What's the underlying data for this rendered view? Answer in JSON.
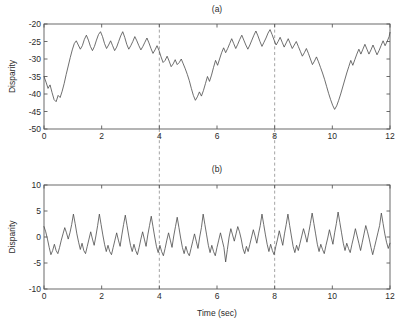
{
  "figure": {
    "xlabel": "Time (sec)",
    "background": "#ffffff",
    "line_color": "#4a4a4a",
    "marker_color": "#9a9a9a",
    "axis_color": "#5a5a5a"
  },
  "chart_data": [
    {
      "type": "line",
      "title": "(a)",
      "xlabel": "",
      "ylabel": "Disparity",
      "xlim": [
        0,
        12
      ],
      "ylim": [
        -50,
        -20
      ],
      "xticks": [
        0,
        2,
        4,
        6,
        8,
        10,
        12
      ],
      "xticklabels": [
        "0",
        "2",
        "4",
        "6",
        "8",
        "10",
        "12"
      ],
      "yticks": [
        -50,
        -45,
        -40,
        -35,
        -30,
        -25,
        -20
      ],
      "yticklabels": [
        "-50",
        "-45",
        "-40",
        "-35",
        "-30",
        "-25",
        "-20"
      ],
      "grid": false,
      "legend": null,
      "annotations": [
        {
          "type": "vline",
          "x": 4,
          "style": "dashed",
          "color": "#9a9a9a"
        },
        {
          "type": "vline",
          "x": 8,
          "style": "dashed",
          "color": "#9a9a9a"
        }
      ],
      "series": [
        {
          "name": "disparity",
          "x": [
            0.0,
            0.07,
            0.14,
            0.21,
            0.28,
            0.35,
            0.42,
            0.49,
            0.56,
            0.63,
            0.7,
            0.77,
            0.84,
            0.91,
            0.98,
            1.05,
            1.12,
            1.19,
            1.26,
            1.33,
            1.4,
            1.47,
            1.54,
            1.61,
            1.68,
            1.75,
            1.82,
            1.89,
            1.96,
            2.03,
            2.1,
            2.17,
            2.24,
            2.31,
            2.38,
            2.45,
            2.52,
            2.59,
            2.66,
            2.73,
            2.8,
            2.87,
            2.94,
            3.01,
            3.08,
            3.15,
            3.22,
            3.29,
            3.36,
            3.43,
            3.5,
            3.57,
            3.64,
            3.71,
            3.78,
            3.85,
            3.92,
            3.99,
            4.06,
            4.13,
            4.2,
            4.27,
            4.34,
            4.41,
            4.48,
            4.55,
            4.62,
            4.69,
            4.76,
            4.83,
            4.9,
            4.97,
            5.04,
            5.11,
            5.18,
            5.25,
            5.32,
            5.39,
            5.46,
            5.53,
            5.6,
            5.67,
            5.74,
            5.81,
            5.88,
            5.95,
            6.02,
            6.09,
            6.16,
            6.23,
            6.3,
            6.37,
            6.44,
            6.51,
            6.58,
            6.65,
            6.72,
            6.79,
            6.86,
            6.93,
            7.0,
            7.07,
            7.14,
            7.21,
            7.28,
            7.35,
            7.42,
            7.49,
            7.56,
            7.63,
            7.7,
            7.77,
            7.84,
            7.91,
            7.98,
            8.05,
            8.12,
            8.19,
            8.26,
            8.33,
            8.4,
            8.47,
            8.54,
            8.61,
            8.68,
            8.75,
            8.82,
            8.89,
            8.96,
            9.03,
            9.1,
            9.17,
            9.24,
            9.31,
            9.38,
            9.45,
            9.52,
            9.59,
            9.66,
            9.73,
            9.8,
            9.87,
            9.94,
            10.01,
            10.08,
            10.15,
            10.22,
            10.29,
            10.36,
            10.43,
            10.5,
            10.57,
            10.64,
            10.71,
            10.78,
            10.85,
            10.92,
            10.99,
            11.06,
            11.13,
            11.2,
            11.27,
            11.34,
            11.41,
            11.48,
            11.55,
            11.62,
            11.69,
            11.76,
            11.83,
            11.9,
            11.97,
            12.0
          ],
          "y": [
            -35.0,
            -36.6,
            -38.4,
            -37.4,
            -39.6,
            -41.6,
            -42.2,
            -40.4,
            -41.0,
            -39.2,
            -37.0,
            -34.4,
            -32.0,
            -29.6,
            -27.4,
            -25.6,
            -24.8,
            -26.0,
            -27.2,
            -26.2,
            -24.4,
            -23.2,
            -24.6,
            -26.4,
            -27.6,
            -26.4,
            -24.6,
            -23.0,
            -22.2,
            -23.6,
            -25.6,
            -27.0,
            -26.0,
            -24.8,
            -26.2,
            -27.6,
            -26.6,
            -25.0,
            -23.4,
            -22.2,
            -23.8,
            -25.8,
            -27.2,
            -26.2,
            -25.0,
            -23.6,
            -24.8,
            -26.2,
            -27.4,
            -26.4,
            -25.2,
            -24.0,
            -25.4,
            -27.0,
            -28.4,
            -27.4,
            -26.2,
            -27.6,
            -29.4,
            -31.0,
            -30.4,
            -29.2,
            -30.6,
            -32.2,
            -31.4,
            -30.2,
            -31.6,
            -31.0,
            -30.0,
            -31.4,
            -32.8,
            -34.4,
            -36.2,
            -38.4,
            -40.4,
            -41.8,
            -40.8,
            -39.4,
            -40.6,
            -39.0,
            -37.0,
            -35.0,
            -36.4,
            -34.6,
            -32.4,
            -30.4,
            -31.8,
            -30.0,
            -28.2,
            -26.8,
            -28.2,
            -27.0,
            -25.6,
            -24.2,
            -25.6,
            -27.0,
            -25.8,
            -24.4,
            -23.2,
            -24.6,
            -26.0,
            -27.2,
            -26.0,
            -24.6,
            -23.2,
            -22.0,
            -23.4,
            -25.0,
            -26.4,
            -25.2,
            -24.0,
            -22.6,
            -21.6,
            -23.0,
            -24.6,
            -26.0,
            -25.0,
            -23.8,
            -25.2,
            -26.6,
            -25.4,
            -24.2,
            -25.6,
            -27.0,
            -26.0,
            -25.0,
            -26.4,
            -27.8,
            -29.2,
            -28.2,
            -27.0,
            -28.4,
            -30.0,
            -31.6,
            -30.6,
            -29.4,
            -30.8,
            -32.4,
            -34.0,
            -35.8,
            -37.8,
            -39.8,
            -41.6,
            -43.2,
            -44.4,
            -43.4,
            -41.8,
            -40.0,
            -38.0,
            -36.0,
            -34.0,
            -32.2,
            -30.4,
            -31.8,
            -30.2,
            -28.6,
            -27.2,
            -28.6,
            -27.2,
            -25.8,
            -27.2,
            -28.6,
            -27.4,
            -26.0,
            -27.4,
            -28.8,
            -27.6,
            -26.2,
            -24.8,
            -26.2,
            -25.0,
            -23.6,
            -22.4,
            -23.8,
            -25.4,
            -24.2,
            -26.0,
            -27.8,
            -26.6,
            -28.4,
            -30.2,
            -29.0,
            -30.8,
            -32.6,
            -34.4,
            -33.2,
            -35.0,
            -36.8,
            -38.6,
            -37.4,
            -39.2,
            -41.0,
            -42.8,
            -44.6,
            -45.6,
            -45.8
          ]
        }
      ]
    },
    {
      "type": "line",
      "title": "(b)",
      "xlabel": "Time (sec)",
      "ylabel": "Disparity",
      "xlim": [
        0,
        12
      ],
      "ylim": [
        -10,
        10
      ],
      "xticks": [
        0,
        2,
        4,
        6,
        8,
        10,
        12
      ],
      "xticklabels": [
        "0",
        "2",
        "4",
        "6",
        "8",
        "10",
        "12"
      ],
      "yticks": [
        -10,
        -5,
        0,
        5,
        10
      ],
      "yticklabels": [
        "-10",
        "-5",
        "0",
        "5",
        "10"
      ],
      "grid": false,
      "legend": null,
      "annotations": [
        {
          "type": "vline",
          "x": 4,
          "style": "dashed",
          "color": "#9a9a9a"
        },
        {
          "type": "vline",
          "x": 8,
          "style": "dashed",
          "color": "#9a9a9a"
        }
      ],
      "series": [
        {
          "name": "residual-disparity",
          "x": [
            0.0,
            0.06,
            0.12,
            0.18,
            0.24,
            0.3,
            0.36,
            0.42,
            0.48,
            0.54,
            0.6,
            0.66,
            0.72,
            0.78,
            0.84,
            0.9,
            0.96,
            1.02,
            1.08,
            1.14,
            1.2,
            1.26,
            1.32,
            1.38,
            1.44,
            1.5,
            1.56,
            1.62,
            1.68,
            1.74,
            1.8,
            1.86,
            1.92,
            1.98,
            2.04,
            2.1,
            2.16,
            2.22,
            2.28,
            2.34,
            2.4,
            2.46,
            2.52,
            2.58,
            2.64,
            2.7,
            2.76,
            2.82,
            2.88,
            2.94,
            3.0,
            3.06,
            3.12,
            3.18,
            3.24,
            3.3,
            3.36,
            3.42,
            3.48,
            3.54,
            3.6,
            3.66,
            3.72,
            3.78,
            3.84,
            3.9,
            3.96,
            4.02,
            4.08,
            4.14,
            4.2,
            4.26,
            4.32,
            4.38,
            4.44,
            4.5,
            4.56,
            4.62,
            4.68,
            4.74,
            4.8,
            4.86,
            4.92,
            4.98,
            5.04,
            5.1,
            5.16,
            5.22,
            5.28,
            5.34,
            5.4,
            5.46,
            5.52,
            5.58,
            5.64,
            5.7,
            5.76,
            5.82,
            5.88,
            5.94,
            6.0,
            6.06,
            6.12,
            6.18,
            6.24,
            6.3,
            6.36,
            6.42,
            6.48,
            6.54,
            6.6,
            6.66,
            6.72,
            6.78,
            6.84,
            6.9,
            6.96,
            7.02,
            7.08,
            7.14,
            7.2,
            7.26,
            7.32,
            7.38,
            7.44,
            7.5,
            7.56,
            7.62,
            7.68,
            7.74,
            7.8,
            7.86,
            7.92,
            7.98,
            8.04,
            8.1,
            8.16,
            8.22,
            8.28,
            8.34,
            8.4,
            8.46,
            8.52,
            8.58,
            8.64,
            8.7,
            8.76,
            8.82,
            8.88,
            8.94,
            9.0,
            9.06,
            9.12,
            9.18,
            9.24,
            9.3,
            9.36,
            9.42,
            9.48,
            9.54,
            9.6,
            9.66,
            9.72,
            9.78,
            9.84,
            9.9,
            9.96,
            10.02,
            10.08,
            10.14,
            10.2,
            10.26,
            10.32,
            10.38,
            10.44,
            10.5,
            10.56,
            10.62,
            10.68,
            10.74,
            10.8,
            10.86,
            10.92,
            10.98,
            11.04,
            11.1,
            11.16,
            11.22,
            11.28,
            11.34,
            11.4,
            11.46,
            11.52,
            11.58,
            11.64,
            11.7,
            11.76,
            11.82,
            11.88,
            11.94,
            12.0
          ],
          "y": [
            2.0,
            1.0,
            -0.4,
            -2.0,
            -3.4,
            -2.6,
            -1.4,
            -2.6,
            -3.2,
            -2.0,
            -0.6,
            0.6,
            1.8,
            0.8,
            -0.4,
            0.8,
            2.4,
            4.4,
            2.6,
            0.6,
            -1.0,
            -2.4,
            -1.2,
            -2.6,
            -3.2,
            -1.8,
            -0.4,
            1.0,
            -0.4,
            -1.6,
            0.2,
            2.2,
            4.4,
            2.4,
            0.4,
            -1.4,
            -2.8,
            -1.6,
            -2.8,
            -3.4,
            -2.0,
            -0.6,
            0.8,
            -0.6,
            -1.8,
            0.4,
            2.4,
            4.2,
            2.2,
            0.2,
            -1.6,
            -2.8,
            -1.4,
            -2.6,
            -3.4,
            -2.0,
            -0.4,
            1.0,
            -0.4,
            -1.8,
            0.4,
            2.2,
            4.0,
            2.0,
            0.0,
            -1.8,
            -3.0,
            -1.6,
            -2.8,
            -3.6,
            -2.2,
            -0.6,
            0.8,
            -0.6,
            -2.0,
            0.2,
            2.0,
            3.8,
            1.8,
            -0.2,
            -2.0,
            -3.2,
            -1.8,
            -3.0,
            -3.6,
            -2.2,
            -0.8,
            0.6,
            -0.8,
            -2.2,
            0.0,
            1.8,
            4.4,
            2.4,
            0.4,
            -1.6,
            -3.0,
            -1.6,
            -2.8,
            -3.6,
            -2.0,
            -0.6,
            0.8,
            -0.6,
            -2.0,
            -4.8,
            -2.4,
            0.0,
            1.6,
            0.4,
            -0.8,
            0.6,
            2.0,
            1.0,
            -0.4,
            -2.2,
            -3.2,
            -1.8,
            -2.8,
            -1.4,
            0.0,
            1.4,
            0.2,
            -1.2,
            0.6,
            2.2,
            4.4,
            2.4,
            0.4,
            -1.4,
            -2.8,
            -1.4,
            -2.6,
            -3.4,
            -1.8,
            -0.4,
            1.2,
            -0.2,
            -1.6,
            0.6,
            2.4,
            4.4,
            2.2,
            0.2,
            -1.8,
            -3.0,
            -1.6,
            -2.6,
            -1.2,
            0.2,
            1.6,
            0.4,
            -1.0,
            0.8,
            2.6,
            4.6,
            2.6,
            0.6,
            -1.4,
            -2.8,
            -1.4,
            -2.4,
            -3.2,
            -1.6,
            -0.2,
            1.4,
            0.0,
            -1.4,
            0.8,
            2.6,
            4.8,
            2.8,
            0.8,
            -1.2,
            -2.6,
            -1.2,
            -2.2,
            -3.0,
            -1.4,
            0.0,
            1.6,
            0.2,
            -1.2,
            -2.6,
            -1.0,
            0.6,
            2.2,
            1.0,
            -0.4,
            -2.0,
            -3.4,
            -2.0,
            -0.6,
            0.8,
            2.2,
            4.6,
            2.6,
            0.6,
            -1.0,
            -2.2,
            -1.2,
            0.2,
            -1.0,
            -1.6
          ]
        }
      ]
    }
  ]
}
